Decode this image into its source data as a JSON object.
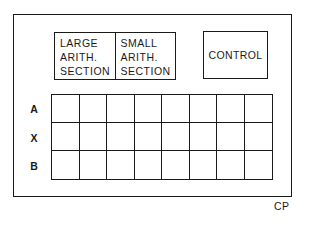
{
  "diagram": {
    "arith_sections": [
      {
        "lines": [
          "LARGE",
          "ARITH.",
          "SECTION"
        ]
      },
      {
        "lines": [
          "SMALL",
          "ARITH.",
          "SECTION"
        ]
      }
    ],
    "control_label": "CONTROL",
    "register_rows": [
      {
        "label": "A"
      },
      {
        "label": "X"
      },
      {
        "label": "B"
      }
    ],
    "register_columns": 8,
    "caption": "CP"
  }
}
